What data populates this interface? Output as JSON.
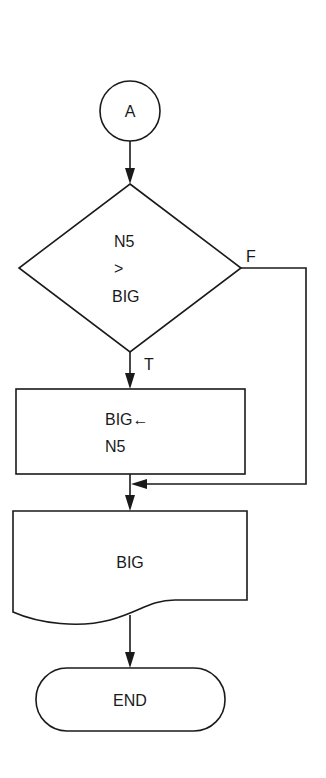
{
  "diagram": {
    "type": "flowchart",
    "nodes": [
      {
        "id": "connector",
        "shape": "circle",
        "text": "A"
      },
      {
        "id": "decision",
        "shape": "diamond",
        "lines": [
          "N5",
          ">",
          "BIG"
        ]
      },
      {
        "id": "process",
        "shape": "rectangle",
        "lines": [
          "BIG←",
          "N5"
        ]
      },
      {
        "id": "output",
        "shape": "document",
        "text": "BIG"
      },
      {
        "id": "terminal",
        "shape": "terminator",
        "text": "END"
      }
    ],
    "edges": [
      {
        "from": "connector",
        "to": "decision",
        "label": ""
      },
      {
        "from": "decision",
        "to": "process",
        "label": "T"
      },
      {
        "from": "decision",
        "to": "output",
        "label": "F"
      },
      {
        "from": "process",
        "to": "output",
        "label": ""
      },
      {
        "from": "output",
        "to": "terminal",
        "label": ""
      }
    ],
    "branch_labels": {
      "true": "T",
      "false": "F"
    }
  }
}
